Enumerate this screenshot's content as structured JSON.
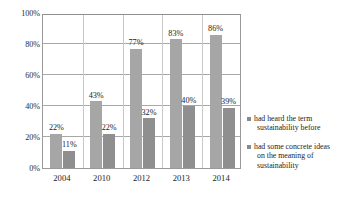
{
  "chart_data": {
    "type": "bar",
    "title": "",
    "subtitle": "",
    "xlabel": "",
    "ylabel": "",
    "ylim": [
      0,
      100
    ],
    "ytick_labels": [
      "100%",
      "80%",
      "60%",
      "40%",
      "20%",
      "0%"
    ],
    "ytick_values": [
      100,
      80,
      60,
      40,
      20,
      0
    ],
    "grid": true,
    "legend_position": "right",
    "value_suffix": "%",
    "categories": [
      "2004",
      "2010",
      "2012",
      "2013",
      "2014"
    ],
    "series": [
      {
        "name": "had heard the term sustainability before",
        "values": [
          22,
          43,
          77,
          83,
          86
        ],
        "labels": [
          "22%",
          "43%",
          "77%",
          "83%",
          "86%"
        ],
        "color": "#a6a6a6"
      },
      {
        "name": "had some concrete ideas on the meaning of sustainability",
        "values": [
          11,
          22,
          32,
          40,
          39
        ],
        "labels": [
          "11%",
          "22%",
          "32%",
          "40%",
          "39%"
        ],
        "color": "#8f8f8f"
      }
    ]
  },
  "legend": {
    "entries": [
      {
        "label_line1": "had heard the term",
        "label_line2": "sustainability before"
      },
      {
        "label_line1": "had some concrete ideas",
        "label_line2": "on the meaning of",
        "label_line3": "sustainability"
      }
    ]
  }
}
